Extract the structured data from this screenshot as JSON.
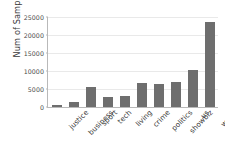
{
  "chart_data": {
    "type": "bar",
    "title": "",
    "xlabel": "",
    "ylabel": "Num of Samples",
    "categories": [
      "justice",
      "business",
      "sport",
      "tech",
      "living",
      "crime",
      "politics",
      "showbiz",
      "us",
      "world"
    ],
    "values": [
      600,
      1500,
      5600,
      2800,
      3100,
      6700,
      6500,
      6900,
      10300,
      23600
    ],
    "ylim": [
      0,
      25000
    ],
    "yticks": [
      0,
      5000,
      10000,
      15000,
      20000,
      25000
    ],
    "ytick_labels": [
      "0",
      "5000",
      "10000",
      "15000",
      "20000",
      "25000"
    ],
    "grid": true,
    "grid_axis": "y",
    "legend": null,
    "bar_color": "#6e6e6e",
    "axis_color": "#b9b9b9",
    "grid_color": "#e9e9e9",
    "background": "#ffffff",
    "xtick_rotation": -45
  }
}
